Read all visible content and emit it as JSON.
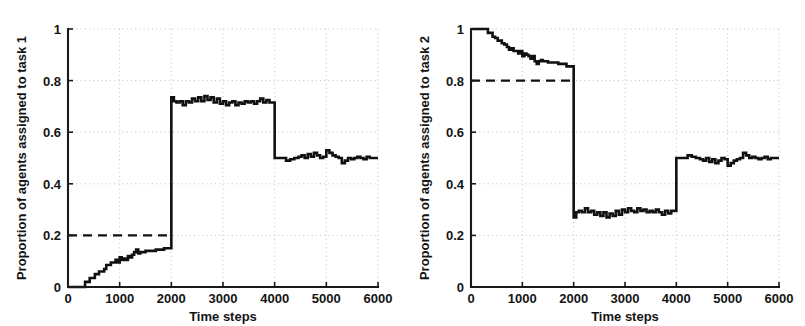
{
  "figure": {
    "background_color": "#ffffff",
    "line_color": "#111111",
    "grid_color": "#b9b9b9"
  },
  "chart_data": [
    {
      "type": "line",
      "panel": "left",
      "title": "",
      "xlabel": "Time steps",
      "ylabel": "Proportion of agents assigned to task 1",
      "xlim": [
        0,
        6000
      ],
      "ylim": [
        0,
        1
      ],
      "xticks": [
        0,
        1000,
        2000,
        3000,
        4000,
        5000,
        6000
      ],
      "xticklabels": [
        "0",
        "1000",
        "2000",
        "3000",
        "4000",
        "5000",
        "6000"
      ],
      "yticks": [
        0,
        0.2,
        0.4,
        0.6,
        0.8,
        1
      ],
      "yticklabels": [
        "0",
        "0.2",
        "0.4",
        "0.6",
        "0.8",
        "1"
      ],
      "grid": true,
      "legend": "none",
      "annotations": [
        {
          "name": "target-proportion-threshold",
          "style": "dashed",
          "y": 0.2,
          "x_start": 0,
          "x_end": 2000,
          "label": "0.2"
        }
      ],
      "series": [
        {
          "name": "proportion-assigned-task-1",
          "style": "step",
          "x": [
            0,
            120,
            300,
            330,
            360,
            420,
            470,
            520,
            560,
            600,
            650,
            700,
            740,
            790,
            830,
            880,
            920,
            960,
            1000,
            1040,
            1080,
            1120,
            1160,
            1200,
            1240,
            1280,
            1320,
            1360,
            1400,
            1450,
            1500,
            1560,
            1620,
            1700,
            1780,
            1860,
            1940,
            1990,
            2000,
            2050,
            2100,
            2160,
            2220,
            2280,
            2340,
            2400,
            2460,
            2520,
            2580,
            2640,
            2700,
            2760,
            2820,
            2880,
            2940,
            3000,
            3060,
            3120,
            3180,
            3240,
            3300,
            3360,
            3420,
            3480,
            3540,
            3600,
            3660,
            3720,
            3780,
            3840,
            3900,
            3960,
            4000,
            4060,
            4140,
            4220,
            4300,
            4380,
            4460,
            4520,
            4580,
            4640,
            4700,
            4760,
            4820,
            4880,
            4940,
            5000,
            5060,
            5120,
            5180,
            5240,
            5300,
            5360,
            5420,
            5480,
            5540,
            5600,
            5660,
            5720,
            5780,
            5840,
            5900,
            6000
          ],
          "y": [
            0.0,
            0.0,
            0.0,
            0.02,
            0.02,
            0.035,
            0.035,
            0.05,
            0.05,
            0.06,
            0.06,
            0.07,
            0.085,
            0.085,
            0.095,
            0.095,
            0.105,
            0.095,
            0.115,
            0.105,
            0.11,
            0.105,
            0.12,
            0.115,
            0.125,
            0.135,
            0.145,
            0.13,
            0.135,
            0.135,
            0.14,
            0.14,
            0.14,
            0.145,
            0.145,
            0.15,
            0.15,
            0.15,
            0.735,
            0.72,
            0.715,
            0.72,
            0.705,
            0.72,
            0.715,
            0.73,
            0.72,
            0.735,
            0.72,
            0.74,
            0.725,
            0.735,
            0.715,
            0.73,
            0.71,
            0.72,
            0.705,
            0.715,
            0.72,
            0.705,
            0.715,
            0.71,
            0.72,
            0.715,
            0.72,
            0.71,
            0.72,
            0.73,
            0.715,
            0.725,
            0.715,
            0.715,
            0.5,
            0.5,
            0.5,
            0.49,
            0.495,
            0.5,
            0.505,
            0.51,
            0.5,
            0.515,
            0.505,
            0.52,
            0.51,
            0.5,
            0.505,
            0.53,
            0.52,
            0.51,
            0.505,
            0.5,
            0.48,
            0.49,
            0.5,
            0.495,
            0.5,
            0.505,
            0.5,
            0.495,
            0.505,
            0.5,
            0.5,
            0.5
          ]
        }
      ]
    },
    {
      "type": "line",
      "panel": "right",
      "title": "",
      "xlabel": "Time steps",
      "ylabel": "Proportion of agents assigned to task 2",
      "xlim": [
        0,
        6000
      ],
      "ylim": [
        0,
        1
      ],
      "xticks": [
        0,
        1000,
        2000,
        3000,
        4000,
        5000,
        6000
      ],
      "xticklabels": [
        "0",
        "1000",
        "2000",
        "3000",
        "4000",
        "5000",
        "6000"
      ],
      "yticks": [
        0,
        0.2,
        0.4,
        0.6,
        0.8,
        1
      ],
      "yticklabels": [
        "0",
        "0.2",
        "0.4",
        "0.6",
        "0.8",
        "1"
      ],
      "grid": true,
      "legend": "none",
      "annotations": [
        {
          "name": "target-proportion-threshold",
          "style": "dashed",
          "y": 0.8,
          "x_start": 0,
          "x_end": 2000,
          "label": "0.8"
        }
      ],
      "series": [
        {
          "name": "proportion-assigned-task-2",
          "style": "step",
          "x": [
            0,
            120,
            300,
            330,
            360,
            420,
            470,
            520,
            560,
            600,
            650,
            700,
            740,
            790,
            830,
            880,
            920,
            960,
            1000,
            1040,
            1080,
            1120,
            1160,
            1200,
            1240,
            1280,
            1320,
            1360,
            1400,
            1450,
            1500,
            1560,
            1620,
            1700,
            1780,
            1860,
            1940,
            1990,
            2000,
            2050,
            2100,
            2160,
            2220,
            2280,
            2340,
            2400,
            2460,
            2520,
            2580,
            2640,
            2700,
            2760,
            2820,
            2880,
            2940,
            3000,
            3060,
            3120,
            3180,
            3240,
            3300,
            3360,
            3420,
            3480,
            3540,
            3600,
            3660,
            3720,
            3780,
            3840,
            3900,
            3960,
            4000,
            4060,
            4140,
            4220,
            4300,
            4380,
            4460,
            4520,
            4580,
            4640,
            4700,
            4760,
            4820,
            4880,
            4940,
            5000,
            5060,
            5120,
            5180,
            5240,
            5300,
            5360,
            5420,
            5480,
            5540,
            5600,
            5660,
            5720,
            5780,
            5840,
            5900,
            6000
          ],
          "y": [
            1.0,
            1.0,
            1.0,
            0.985,
            0.985,
            0.97,
            0.965,
            0.955,
            0.955,
            0.945,
            0.94,
            0.93,
            0.92,
            0.925,
            0.915,
            0.915,
            0.905,
            0.915,
            0.895,
            0.905,
            0.9,
            0.895,
            0.885,
            0.895,
            0.875,
            0.865,
            0.875,
            0.88,
            0.875,
            0.875,
            0.87,
            0.87,
            0.87,
            0.865,
            0.865,
            0.855,
            0.855,
            0.855,
            0.27,
            0.29,
            0.295,
            0.29,
            0.305,
            0.29,
            0.295,
            0.28,
            0.29,
            0.275,
            0.29,
            0.27,
            0.285,
            0.275,
            0.295,
            0.28,
            0.3,
            0.29,
            0.305,
            0.295,
            0.29,
            0.305,
            0.295,
            0.3,
            0.29,
            0.295,
            0.29,
            0.3,
            0.29,
            0.28,
            0.295,
            0.285,
            0.295,
            0.295,
            0.5,
            0.5,
            0.5,
            0.51,
            0.505,
            0.5,
            0.495,
            0.49,
            0.5,
            0.485,
            0.495,
            0.48,
            0.49,
            0.5,
            0.495,
            0.47,
            0.48,
            0.49,
            0.495,
            0.5,
            0.52,
            0.51,
            0.5,
            0.505,
            0.5,
            0.495,
            0.5,
            0.505,
            0.495,
            0.5,
            0.5,
            0.5
          ]
        }
      ]
    }
  ]
}
